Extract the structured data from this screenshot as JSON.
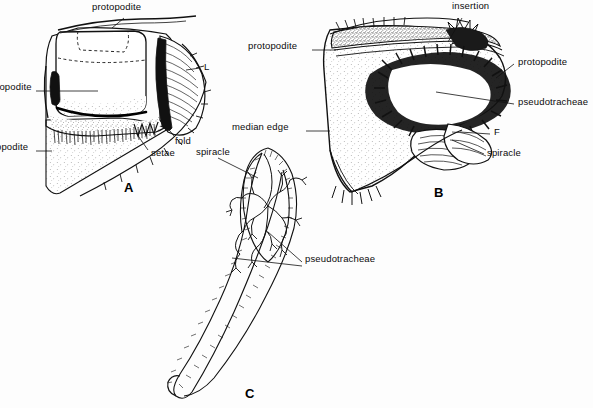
{
  "figure": {
    "background_color": "#fdfdfd",
    "ink_color": "#0b0b0b",
    "width": 593,
    "height": 408
  },
  "panels": [
    {
      "id": "A",
      "letter": "A",
      "caption": "Lateral view of labellum showing podite lobes, setae fringe and spiracle",
      "letter_pos": {
        "x": 124,
        "y": 181
      }
    },
    {
      "id": "B",
      "letter": "B",
      "caption": "Oral surface of labellum showing pseudotracheae and median edge",
      "letter_pos": {
        "x": 434,
        "y": 186
      }
    },
    {
      "id": "C",
      "letter": "C",
      "caption": "Isolated pseudotracheal trunk with branching tubules",
      "letter_pos": {
        "x": 245,
        "y": 387
      }
    }
  ],
  "labels": [
    {
      "id": "a-protopodite",
      "text": "protopodite",
      "x": 92,
      "y": 6,
      "panel": "A",
      "clipped": false
    },
    {
      "id": "a-endopodite",
      "text": "dopodite",
      "x": -6,
      "y": 86,
      "panel": "A",
      "clipped": true,
      "full_text": "endopodite"
    },
    {
      "id": "a-exopodite",
      "text": "opodite",
      "x": -4,
      "y": 146,
      "panel": "A",
      "clipped": true,
      "full_text": "exopodite"
    },
    {
      "id": "a-L",
      "text": "L",
      "x": 204,
      "y": 66,
      "panel": "A",
      "clipped": false
    },
    {
      "id": "a-fold",
      "text": "fold",
      "x": 175,
      "y": 140,
      "panel": "A",
      "clipped": false
    },
    {
      "id": "a-setae",
      "text": "setae",
      "x": 151,
      "y": 152,
      "panel": "A",
      "clipped": false
    },
    {
      "id": "a-spiracle",
      "text": "spiracle",
      "x": 196,
      "y": 151,
      "panel": "A",
      "clipped": false
    },
    {
      "id": "b-insertion",
      "text": "insertion",
      "x": 452,
      "y": 4,
      "panel": "B",
      "clipped": false
    },
    {
      "id": "b-protopodite-left",
      "text": "protopodite",
      "x": 248,
      "y": 45,
      "panel": "B",
      "clipped": false
    },
    {
      "id": "b-protopodite-right",
      "text": "protopodite",
      "x": 518,
      "y": 61,
      "panel": "B",
      "clipped": false
    },
    {
      "id": "b-pseudotracheae",
      "text": "pseudotracheae",
      "x": 518,
      "y": 101,
      "panel": "B",
      "clipped": false
    },
    {
      "id": "b-median-edge",
      "text": "median  edge",
      "x": 232,
      "y": 126,
      "panel": "B",
      "clipped": false
    },
    {
      "id": "b-F",
      "text": "F",
      "x": 494,
      "y": 131,
      "panel": "B",
      "clipped": false
    },
    {
      "id": "b-spiracle",
      "text": "spiracle",
      "x": 487,
      "y": 152,
      "panel": "B",
      "clipped": false
    },
    {
      "id": "c-pseudotracheae",
      "text": "pseudotracheae",
      "x": 305,
      "y": 258,
      "panel": "C",
      "clipped": false
    }
  ]
}
